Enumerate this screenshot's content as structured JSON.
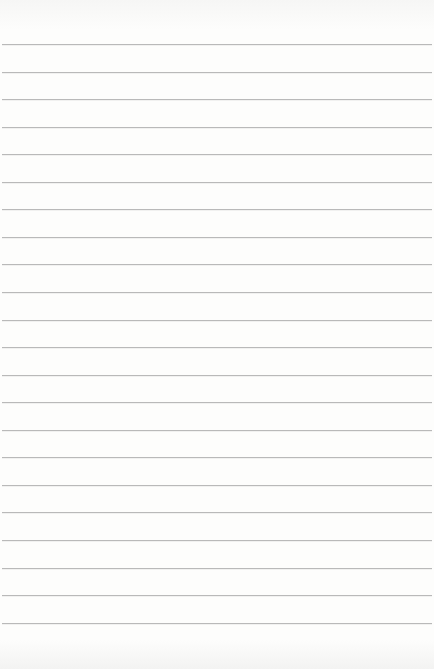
{
  "document": {
    "type": "lined-paper",
    "rule_count": 22,
    "rule_color": "#b9b9b9",
    "paper_color": "#fdfdfc",
    "text_lines": []
  }
}
